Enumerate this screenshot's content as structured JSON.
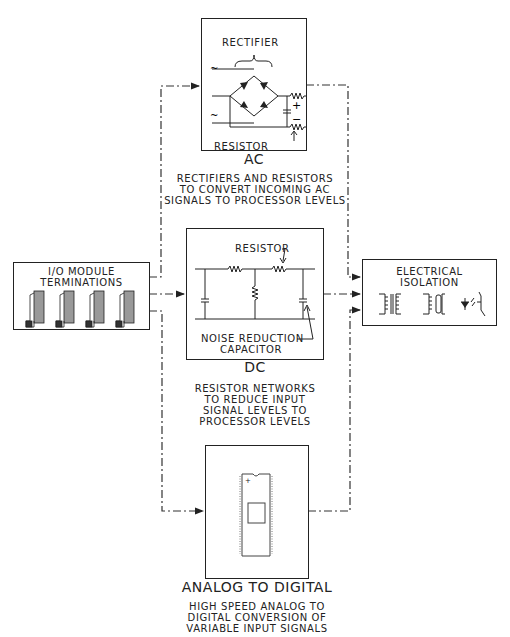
{
  "ac": {
    "title": "AC",
    "rectifier_label": "RECTIFIER",
    "resistor_label": "RESISTOR",
    "plus": "+",
    "minus": "−",
    "tilde": "~",
    "description": "RECTIFIERS AND RESISTORS\nTO CONVERT INCOMING AC\nSIGNALS TO PROCESSOR LEVELS"
  },
  "dc": {
    "title": "DC",
    "resistor_label": "RESISTOR",
    "capacitor_label": "NOISE REDUCTION\nCAPACITOR",
    "description": "RESISTOR NETWORKS\nTO REDUCE INPUT\nSIGNAL LEVELS TO\nPROCESSOR LEVELS"
  },
  "ad": {
    "title": "ANALOG TO DIGITAL",
    "description": "HIGH SPEED ANALOG TO\nDIGITAL CONVERSION OF\nVARIABLE INPUT SIGNALS"
  },
  "io": {
    "title": "I/O MODULE\nTERMINATIONS"
  },
  "isolation": {
    "title": "ELECTRICAL\nISOLATION"
  }
}
